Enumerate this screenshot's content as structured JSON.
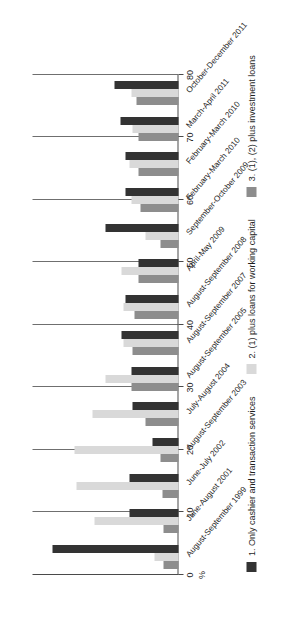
{
  "chart_data": {
    "type": "bar",
    "orientation": "horizontal",
    "title": "",
    "xlabel": "%",
    "ylabel": "",
    "xlim": [
      0,
      80
    ],
    "xticks": [
      0,
      10,
      20,
      30,
      40,
      50,
      60,
      70,
      80
    ],
    "xticklabels": [
      "0",
      "10",
      "20",
      "30",
      "40",
      "50",
      "60",
      "70",
      "80"
    ],
    "grid": true,
    "legend_position": "bottom",
    "categories": [
      "August-September 1999",
      "June-August 2001",
      "June-July 2002",
      "August-September 2003",
      "July-August 2004",
      "August-September 2005",
      "August-September 2007",
      "August-September 2008",
      "April-May 2009",
      "September-October 2009",
      "February-March 2010",
      "February-March 2010",
      "March-April 2011",
      "October-December 2011"
    ],
    "series": [
      {
        "name": "1. Only cashier and transaction services",
        "color": "#333333",
        "values": [
          69,
          27,
          27,
          14,
          25,
          26,
          31,
          29,
          22,
          40,
          29,
          29,
          32,
          35
        ]
      },
      {
        "name": "2. (1) plus loans for working capital",
        "color": "#d9d9d9",
        "values": [
          13,
          46,
          56,
          57,
          47,
          40,
          30,
          30,
          31,
          18,
          26,
          27,
          25,
          26
        ]
      },
      {
        "name": "3. (1), (2) plus investment loans",
        "color": "#8d8d8d",
        "values": [
          8,
          8,
          9,
          10,
          18,
          26,
          25,
          24,
          22,
          10,
          21,
          22,
          22,
          23
        ]
      }
    ]
  },
  "axis": {
    "unit_label": "%"
  },
  "legend": {
    "items": [
      {
        "label": "1. Only cashier and transaction services",
        "color": "#333333"
      },
      {
        "label": "2. (1) plus loans for working capital",
        "color": "#d9d9d9"
      },
      {
        "label": "3. (1), (2) plus investment loans",
        "color": "#8d8d8d"
      }
    ]
  }
}
